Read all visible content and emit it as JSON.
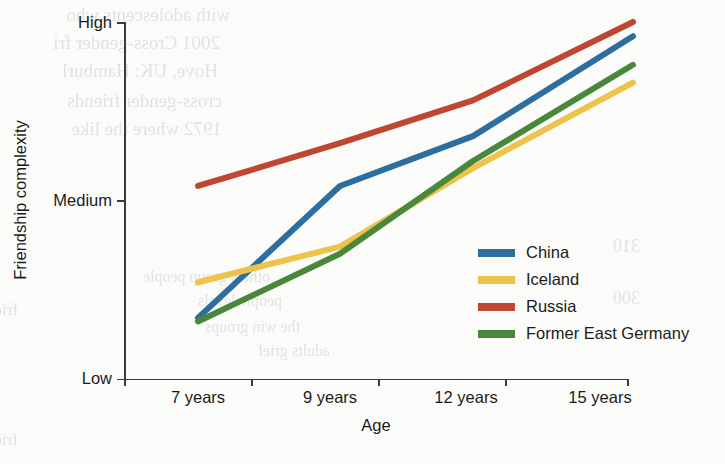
{
  "chart_data": {
    "type": "line",
    "title": "",
    "xlabel": "Age",
    "ylabel": "Friendship complexity",
    "categories": [
      "7 years",
      "9 years",
      "12 years",
      "15 years"
    ],
    "ytick_labels": [
      "Low",
      "Medium",
      "High"
    ],
    "ytick_values": [
      0,
      0.5,
      1
    ],
    "ylim": [
      0,
      1
    ],
    "grid": false,
    "legend_position": "inside-right",
    "value_scale_note": "Ordinal axis: 0 = Low, 0.5 = Medium, 1 = High",
    "series": [
      {
        "name": "China",
        "color": "#2d6e9e",
        "values": [
          0.17,
          0.54,
          0.68,
          0.96
        ]
      },
      {
        "name": "Iceland",
        "color": "#edc34b",
        "values": [
          0.27,
          0.37,
          0.59,
          0.83
        ]
      },
      {
        "name": "Russia",
        "color": "#bf4630",
        "values": [
          0.54,
          0.66,
          0.78,
          1.0
        ]
      },
      {
        "name": "Former East Germany",
        "color": "#49883a",
        "values": [
          0.16,
          0.35,
          0.61,
          0.88
        ]
      }
    ]
  },
  "axes": {
    "y_title": "Friendship complexity",
    "x_title": "Age",
    "y_ticks": [
      {
        "label": "High",
        "value": 1
      },
      {
        "label": "Medium",
        "value": 0.5
      },
      {
        "label": "Low",
        "value": 0
      }
    ],
    "x_ticks": [
      "7 years",
      "9 years",
      "12 years",
      "15 years"
    ]
  },
  "legend": {
    "items": [
      {
        "label": "China",
        "color": "#2d6e9e"
      },
      {
        "label": "Iceland",
        "color": "#edc34b"
      },
      {
        "label": "Russia",
        "color": "#bf4630"
      },
      {
        "label": "Former East Germany",
        "color": "#49883a"
      }
    ]
  },
  "background_bleed_through": {
    "note": "Faint mirrored text showing through from the reverse side of the scanned page",
    "lines": [
      "with adolescents who",
      "2001 Cross-gender fri",
      "Hove, UK: Hamburl",
      "cross-gender friends",
      "1972 where the like",
      "friends",
      "310",
      "300",
      "others  group  people",
      "people levels",
      "the win groups",
      "adults grief",
      "friendship"
    ]
  }
}
